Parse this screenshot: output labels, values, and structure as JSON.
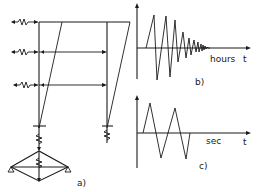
{
  "figure": {
    "panel_a": {
      "label": "a)",
      "description": "Frame structure with lateral springs at three floor levels and spring-supported base truss"
    },
    "panel_b": {
      "label": "b)",
      "x_unit": "hours",
      "x_axis_symbol": "t",
      "description": "Decaying oscillation time history"
    },
    "panel_c": {
      "label": "c)",
      "x_unit": "sec",
      "x_axis_symbol": "t",
      "description": "Short triangular pulse oscillation time history"
    }
  },
  "colors": {
    "ink": "#1a1a1a",
    "background": "#ffffff"
  }
}
